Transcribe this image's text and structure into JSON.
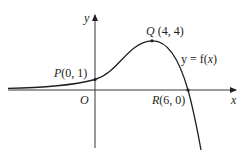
{
  "diagram": {
    "type": "function-graph",
    "axes": {
      "x_label": "x",
      "y_label": "y",
      "origin_label": "O"
    },
    "curve": {
      "label": "y = f(x)",
      "label_parts": {
        "lhs": "y = f(",
        "var": "x",
        "rhs": ")"
      },
      "color": "#231f20"
    },
    "points": [
      {
        "id": "P",
        "name": "P",
        "coords": "(0, 1)",
        "x": 0,
        "y": 1
      },
      {
        "id": "Q",
        "name": "Q",
        "coords": "(4, 4)",
        "x": 4,
        "y": 4
      },
      {
        "id": "R",
        "name": "R",
        "coords": "(6, 0)",
        "x": 6,
        "y": 0
      }
    ]
  }
}
